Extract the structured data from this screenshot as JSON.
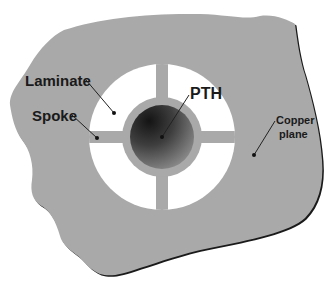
{
  "diagram": {
    "labels": {
      "laminate": "Laminate",
      "spoke": "Spoke",
      "pth": "PTH",
      "copper_plane_line1": "Copper",
      "copper_plane_line2": "plane"
    },
    "components": [
      {
        "id": "copper-plane",
        "label": "Copper plane",
        "shape": "irregular-blob",
        "color": "#a9a9a9"
      },
      {
        "id": "laminate",
        "label": "Laminate",
        "shape": "annulus-segments",
        "count": 4,
        "color": "#ffffff"
      },
      {
        "id": "spoke",
        "label": "Spoke",
        "shape": "rectangular-bridge",
        "count": 4,
        "color": "#a9a9a9"
      },
      {
        "id": "pth",
        "label": "PTH",
        "shape": "circle",
        "color": "#3a3a3a"
      }
    ],
    "colors": {
      "background": "#ffffff",
      "copper": "#a9a9a9",
      "laminate": "#ffffff",
      "pth_dark": "#1e1e1e",
      "pth_light": "#8a8a8a",
      "shadow_edge": "#1a1a1a",
      "leader_line": "#222222"
    }
  }
}
